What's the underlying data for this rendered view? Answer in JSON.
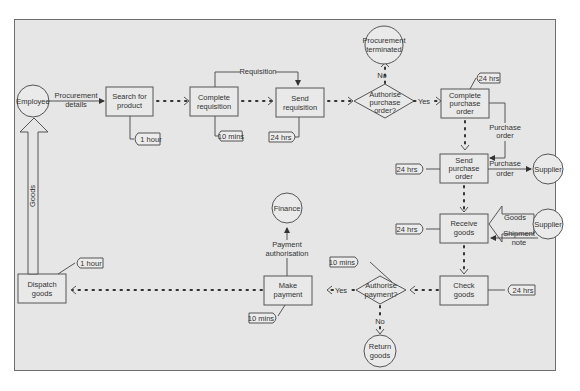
{
  "diagram": {
    "colors": {
      "background": "#e6e6e6",
      "border": "#6e6e6e",
      "stroke": "#555555",
      "text": "#333333"
    },
    "entities": {
      "employee": "Employee",
      "procurement_terminated": [
        "Procurement",
        "terminated"
      ],
      "supplier_top": "Supplier",
      "supplier_mid": "Supplier",
      "finance": "Finance",
      "return_goods": [
        "Return",
        "goods"
      ]
    },
    "processes": {
      "search_for_product": [
        "Search for",
        "product"
      ],
      "complete_requisition": [
        "Complete",
        "requisition"
      ],
      "send_requisition": [
        "Send",
        "requisition"
      ],
      "complete_purchase_order": [
        "Complete",
        "purchase",
        "order"
      ],
      "send_purchase_order": [
        "Send",
        "purchase",
        "order"
      ],
      "receive_goods": [
        "Receive",
        "goods"
      ],
      "check_goods": [
        "Check",
        "goods"
      ],
      "make_payment": [
        "Make",
        "payment"
      ],
      "dispatch_goods": [
        "Dispatch",
        "goods"
      ]
    },
    "decisions": {
      "authorise_purchase_order": [
        "Authorise",
        "purchase",
        "order?"
      ],
      "authorise_payment": [
        "Authorise",
        "payment?"
      ]
    },
    "flows": {
      "procurement_details": [
        "Procurement",
        "details"
      ],
      "requisition": "Requisition",
      "no_top": "No",
      "yes_top": "Yes",
      "purchase_order_internal": [
        "Purchase",
        "order"
      ],
      "purchase_order_to_supplier": [
        "Purchase",
        "order"
      ],
      "goods_from_supplier": "Goods",
      "shipment_note": [
        "Shipment",
        "note"
      ],
      "yes_bottom": "Yes",
      "no_bottom": "No",
      "payment_authorisation": [
        "Payment",
        "authorisation"
      ],
      "goods_to_employee": "Goods"
    },
    "durations": {
      "search_for_product": "1 hour",
      "complete_requisition": "10 mins",
      "send_requisition": "24 hrs",
      "complete_purchase_order": "24 hrs",
      "send_purchase_order": "24 hrs",
      "receive_goods": "24 hrs",
      "check_goods": "24 hrs",
      "authorise_payment": "10 mins",
      "make_payment": "10 mins",
      "dispatch_goods": "1 hour"
    }
  }
}
